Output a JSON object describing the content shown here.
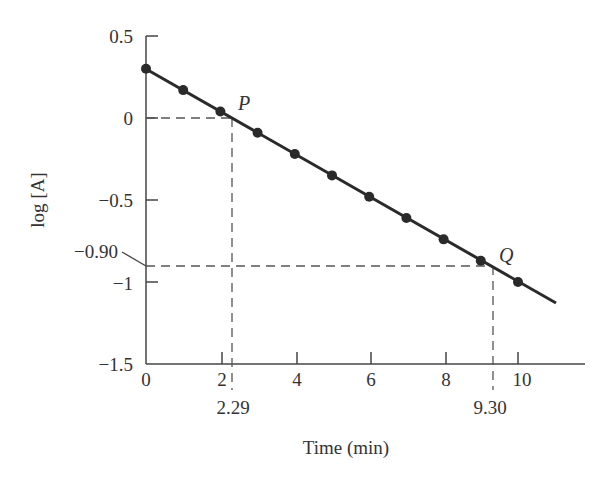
{
  "chart_data": {
    "type": "line",
    "title": "",
    "xlabel": "Time (min)",
    "ylabel": "log [A]",
    "xlim": [
      0,
      12
    ],
    "ylim": [
      -1.5,
      0.5
    ],
    "grid": false,
    "legend": null,
    "x_ticks": [
      "0",
      "2",
      "4",
      "6",
      "8",
      "10"
    ],
    "y_ticks": [
      "0.5",
      "0",
      "−0.5",
      "−1",
      "−1.5"
    ],
    "series": [
      {
        "name": "log [A]",
        "x": [
          0,
          1,
          2,
          3,
          4,
          5,
          6,
          7,
          8,
          9,
          10
        ],
        "values": [
          0.3,
          0.17,
          0.04,
          -0.09,
          -0.22,
          -0.35,
          -0.48,
          -0.61,
          -0.74,
          -0.87,
          -1.0
        ]
      }
    ],
    "fit_line": {
      "x_start": 0,
      "y_start": 0.3,
      "x_end": 11,
      "y_end": -1.13
    },
    "annotations": [
      {
        "label": "P",
        "x": 2.29,
        "y": 0,
        "x_label": "2.29"
      },
      {
        "label": "Q",
        "x": 9.3,
        "y": -0.9,
        "x_label": "9.30",
        "y_label": "−0.90"
      }
    ]
  }
}
